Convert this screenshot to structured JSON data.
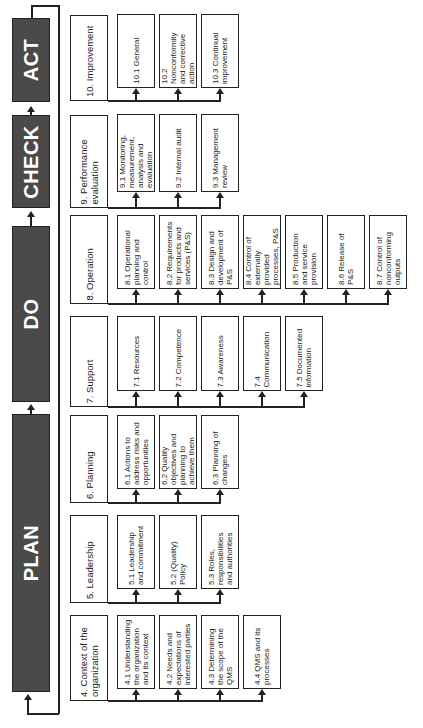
{
  "phases": [
    {
      "id": "act",
      "label": "ACT"
    },
    {
      "id": "check",
      "label": "CHECK"
    },
    {
      "id": "do",
      "label": "DO"
    },
    {
      "id": "plan",
      "label": "PLAN"
    }
  ],
  "clauses": [
    {
      "label": "10. Improvement",
      "subs": [
        "10.1 General",
        "10.2 Nonconformity and corrective action",
        "10.3 Continual improvement"
      ]
    },
    {
      "label": "9. Performance evaluation",
      "subs": [
        "9.1 Monitoring, measurement, analysis and evaluation",
        "9.2 Internal audit",
        "9.3 Management review"
      ]
    },
    {
      "label": "8. Operation",
      "subs": [
        "8.1 Operational planning and control",
        "8.2 Requirements for products and services (P&S)",
        "8.3 Design and development of P&S",
        "8.4 Control of externally provided processes, P&S",
        "8.5 Production and service provision",
        "8.6 Release of P&S",
        "8.7 Control of nonconforming outputs"
      ]
    },
    {
      "label": "7. Support",
      "subs": [
        "7.1 Resources",
        "7.2 Competence",
        "7.3 Awareness",
        "7.4 Communication",
        "7.5 Documented information"
      ]
    },
    {
      "label": "6. Planning",
      "subs": [
        "6.1 Actions to address risks and opportunities",
        "6.2 Quality objectives and planning to achieve them",
        "6.3 Planning of changes"
      ]
    },
    {
      "label": "5. Leadership",
      "subs": [
        "5.1 Leadership and commitment",
        "5.2 (Quality) Policy",
        "5.3 Roles, responsibilities and authorities"
      ]
    },
    {
      "label": "4. Context of the organization",
      "subs": [
        "4.1 Understanding the organization and its context",
        "4.2 Needs and expectations of interested parties",
        "4.3 Determining the scope of the QMS",
        "4.4 QMS and its processes"
      ]
    }
  ],
  "colors": {
    "phase_fill": "#4a4a4a",
    "line": "#222222",
    "background": "#ffffff"
  }
}
